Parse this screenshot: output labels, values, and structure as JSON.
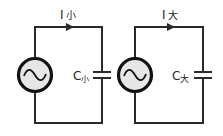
{
  "diagram": {
    "type": "circuit-comparison",
    "colors": {
      "wire": "#2a2a2a",
      "source_fill": "#e6e6e6",
      "background": "#ffffff"
    },
    "circuits": [
      {
        "id": "small",
        "current_label": {
          "symbol": "I",
          "subscript": "小"
        },
        "capacitor_label": {
          "symbol": "C",
          "subscript": "小"
        },
        "source": "ac-source"
      },
      {
        "id": "large",
        "current_label": {
          "symbol": "I",
          "subscript": "大"
        },
        "capacitor_label": {
          "symbol": "C",
          "subscript": "大"
        },
        "source": "ac-source"
      }
    ]
  }
}
